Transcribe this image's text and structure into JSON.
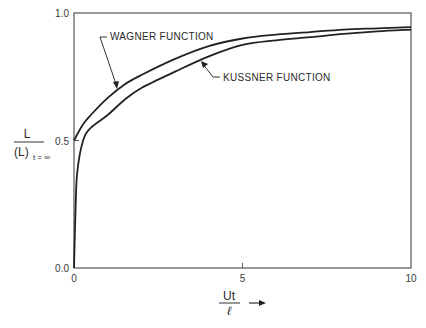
{
  "chart_data": {
    "type": "line",
    "title": "",
    "xlabel": {
      "numerator": "Ut",
      "denominator": "ℓ",
      "arrow": "→"
    },
    "ylabel": {
      "numerator": "L",
      "denominator": "(L)",
      "subscript": "t = ∞"
    },
    "xlim": [
      0,
      10
    ],
    "ylim": [
      0.0,
      1.0
    ],
    "x_ticks": [
      {
        "value": 0,
        "label": "0"
      },
      {
        "value": 5,
        "label": "5"
      },
      {
        "value": 10,
        "label": "10"
      }
    ],
    "y_ticks": [
      {
        "value": 0.0,
        "label": "0.0"
      },
      {
        "value": 0.5,
        "label": "0.5"
      },
      {
        "value": 1.0,
        "label": "1.0"
      }
    ],
    "grid": false,
    "legend": "none (inline annotations)",
    "series": [
      {
        "name": "WAGNER FUNCTION",
        "x": [
          0,
          0.25,
          0.5,
          1,
          1.5,
          2,
          3,
          4,
          5,
          6,
          7,
          8,
          9,
          10
        ],
        "y": [
          0.5,
          0.56,
          0.6,
          0.667,
          0.72,
          0.757,
          0.82,
          0.87,
          0.9,
          0.915,
          0.925,
          0.935,
          0.94,
          0.945
        ]
      },
      {
        "name": "KUSSNER FUNCTION",
        "x": [
          0,
          0.05,
          0.1,
          0.27,
          0.5,
          1,
          1.5,
          2,
          3,
          4,
          5,
          6,
          7,
          8,
          9,
          10
        ],
        "y": [
          0.0,
          0.25,
          0.38,
          0.5,
          0.55,
          0.6,
          0.66,
          0.706,
          0.77,
          0.83,
          0.875,
          0.893,
          0.905,
          0.918,
          0.928,
          0.935
        ]
      }
    ],
    "annotations": [
      {
        "text": "WAGNER FUNCTION",
        "points_to_series": "WAGNER FUNCTION",
        "at_x": 1.3
      },
      {
        "text": "KUSSNER FUNCTION",
        "points_to_series": "KUSSNER FUNCTION",
        "at_x": 3.8
      }
    ]
  }
}
